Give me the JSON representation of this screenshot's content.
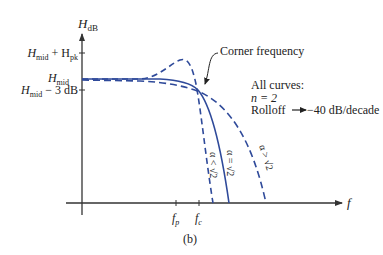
{
  "figure": {
    "caption": "(b)",
    "colors": {
      "axis": "#333333",
      "curve": "#2f4a9a",
      "text": "#222222"
    }
  },
  "axes": {
    "y_label": "H",
    "y_label_sub": "dB",
    "x_label": "f",
    "y_ticks": [
      {
        "main": "H",
        "sub": "mid",
        "extra": " + H",
        "extra_sub": "pk"
      },
      {
        "main": "H",
        "sub": "mid",
        "extra": "",
        "extra_sub": ""
      },
      {
        "main": "H",
        "sub": "mid",
        "extra": " − 3 dB",
        "extra_sub": ""
      }
    ],
    "x_ticks": [
      {
        "main": "f",
        "sub": "p"
      },
      {
        "main": "f",
        "sub": "c"
      }
    ]
  },
  "annotations": {
    "corner": "Corner frequency",
    "all_curves": "All curves:",
    "order": "n = 2",
    "rolloff_label": "Rolloff",
    "rolloff_value": "−40 dB/decade"
  },
  "curves": [
    {
      "name": "alpha-less-than-root2",
      "label": "α < √2",
      "style": "dashed"
    },
    {
      "name": "alpha-equals-root2",
      "label": "α = √2",
      "style": "solid"
    },
    {
      "name": "alpha-greater-than-root2",
      "label": "α > √2",
      "style": "dashed"
    }
  ]
}
